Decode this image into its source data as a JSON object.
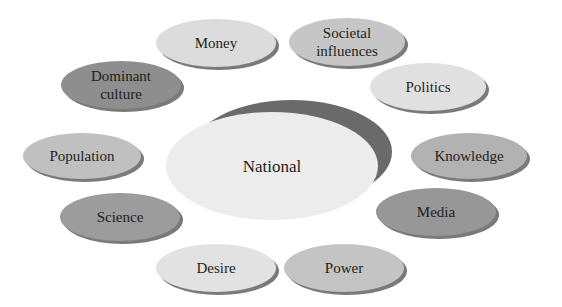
{
  "diagram": {
    "center": {
      "label": "National",
      "fill": "#ececec",
      "shadow": "#6a6a6a"
    },
    "nodes": [
      {
        "id": "money",
        "lines": [
          "Money"
        ],
        "fill": "#dcdcdc",
        "text": "#1e1e1e"
      },
      {
        "id": "societal-influences",
        "lines": [
          "Societal",
          "influences"
        ],
        "fill": "#c6c6c6",
        "text": "#1e1e1e"
      },
      {
        "id": "dominant-culture",
        "lines": [
          "Dominant",
          "culture"
        ],
        "fill": "#8e8e8e",
        "text": "#f0f0f0"
      },
      {
        "id": "politics",
        "lines": [
          "Politics"
        ],
        "fill": "#e0e0e0",
        "text": "#1e1e1e"
      },
      {
        "id": "population",
        "lines": [
          "Population"
        ],
        "fill": "#c0c0c0",
        "text": "#1e1e1e"
      },
      {
        "id": "knowledge",
        "lines": [
          "Knowledge"
        ],
        "fill": "#b2b2b2",
        "text": "#1e1e1e"
      },
      {
        "id": "science",
        "lines": [
          "Science"
        ],
        "fill": "#9c9c9c",
        "text": "#1e1e1e"
      },
      {
        "id": "media",
        "lines": [
          "Media"
        ],
        "fill": "#979797",
        "text": "#1e1e1e"
      },
      {
        "id": "desire",
        "lines": [
          "Desire"
        ],
        "fill": "#e2e2e2",
        "text": "#1e1e1e"
      },
      {
        "id": "power",
        "lines": [
          "Power"
        ],
        "fill": "#c4c4c4",
        "text": "#1e1e1e"
      }
    ],
    "node_shadow": "#7a7a7a"
  }
}
